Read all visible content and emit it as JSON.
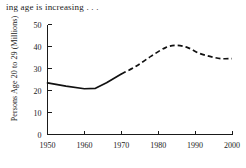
{
  "chart_data": {
    "type": "line",
    "title": "ing age is increasing . . .",
    "xlabel": "",
    "ylabel": "Persons Age 20 to 29 (Millions)",
    "xlim": [
      1950,
      2000
    ],
    "ylim": [
      0,
      50
    ],
    "xticks": [
      "1950",
      "1960",
      "1970",
      "1980",
      "1990",
      "2000"
    ],
    "xtick_values": [
      1950,
      1960,
      1970,
      1980,
      1990,
      2000
    ],
    "yticks": [
      "0",
      "10",
      "20",
      "30",
      "40",
      "50"
    ],
    "ytick_values": [
      0,
      10,
      20,
      30,
      40,
      50
    ],
    "grid": false,
    "legend": "none",
    "series": [
      {
        "name": "Actual",
        "style": "solid",
        "x": [
          1950,
          1955,
          1960,
          1963,
          1966,
          1970
        ],
        "values": [
          23.5,
          22.0,
          20.8,
          21.0,
          23.5,
          27.5
        ]
      },
      {
        "name": "Projected",
        "style": "dashed",
        "x": [
          1970,
          1974,
          1978,
          1982,
          1985,
          1988,
          1991,
          1994,
          1997,
          2000
        ],
        "values": [
          27.5,
          31.0,
          35.5,
          39.5,
          40.5,
          39.5,
          37.0,
          35.5,
          34.5,
          34.5
        ]
      }
    ]
  },
  "axis": {
    "y_label_text": "Persons Age 20 to 29 (Millions)"
  }
}
